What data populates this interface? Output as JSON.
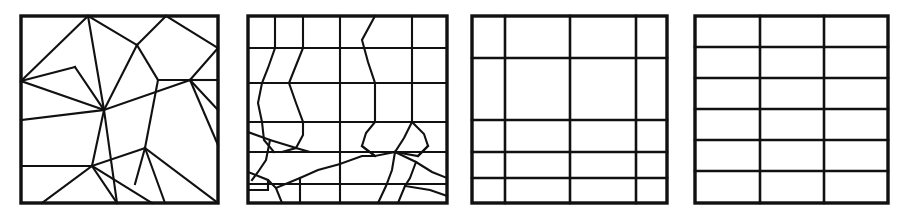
{
  "figure": {
    "title": "",
    "background_color": "#ffffff",
    "line_color": "#111111",
    "width": 908,
    "height": 216,
    "panel_count": 4
  },
  "chart_data": {
    "type": "diagram",
    "subtype": "mesh-partition-sequence",
    "title": "",
    "xlabel": "",
    "ylabel": "",
    "grid": false,
    "legend": null,
    "panels": [
      {
        "id": "panel-1",
        "label": "",
        "mesh_type": "unstructured-triangular",
        "cell_count": 26,
        "frame": {
          "x": 21,
          "y": 16,
          "width": 197,
          "height": 187
        },
        "frame_stroke_width": 3.4,
        "edge_stroke_width": 2.1,
        "vertices": [
          [
            21,
            16
          ],
          [
            218,
            16
          ],
          [
            218,
            203
          ],
          [
            21,
            203
          ],
          [
            88,
            16
          ],
          [
            166,
            16
          ],
          [
            21,
            81
          ],
          [
            75,
            67
          ],
          [
            137,
            45
          ],
          [
            104,
            110
          ],
          [
            158,
            80
          ],
          [
            218,
            80
          ],
          [
            182,
            80
          ],
          [
            21,
            120
          ],
          [
            21,
            166
          ],
          [
            92,
            166
          ],
          [
            135,
            148
          ],
          [
            166,
            126
          ],
          [
            190,
            104
          ],
          [
            218,
            110
          ],
          [
            42,
            203
          ],
          [
            117,
            203
          ],
          [
            165,
            203
          ],
          [
            196,
            203
          ],
          [
            152,
            203
          ],
          [
            218,
            145
          ]
        ],
        "edges": [
          [
            [
              21,
              16
            ],
            [
              218,
              16
            ]
          ],
          [
            [
              218,
              16
            ],
            [
              218,
              203
            ]
          ],
          [
            [
              218,
              203
            ],
            [
              21,
              203
            ]
          ],
          [
            [
              21,
              203
            ],
            [
              21,
              16
            ]
          ],
          [
            [
              88,
              16
            ],
            [
              21,
              81
            ]
          ],
          [
            [
              88,
              16
            ],
            [
              104,
              110
            ]
          ],
          [
            [
              88,
              16
            ],
            [
              137,
              45
            ]
          ],
          [
            [
              137,
              45
            ],
            [
              166,
              16
            ]
          ],
          [
            [
              137,
              45
            ],
            [
              104,
              110
            ]
          ],
          [
            [
              137,
              45
            ],
            [
              158,
              80
            ]
          ],
          [
            [
              166,
              16
            ],
            [
              218,
              48
            ]
          ],
          [
            [
              218,
              48
            ],
            [
              190,
              80
            ]
          ],
          [
            [
              190,
              80
            ],
            [
              218,
              80
            ]
          ],
          [
            [
              190,
              80
            ],
            [
              158,
              80
            ]
          ],
          [
            [
              158,
              80
            ],
            [
              145,
              148
            ]
          ],
          [
            [
              145,
              148
            ],
            [
              135,
              184
            ]
          ],
          [
            [
              21,
              81
            ],
            [
              75,
              67
            ]
          ],
          [
            [
              75,
              67
            ],
            [
              104,
              110
            ]
          ],
          [
            [
              21,
              81
            ],
            [
              104,
              110
            ]
          ],
          [
            [
              21,
              81
            ],
            [
              21,
              120
            ]
          ],
          [
            [
              21,
              120
            ],
            [
              104,
              110
            ]
          ],
          [
            [
              21,
              120
            ],
            [
              21,
              166
            ]
          ],
          [
            [
              104,
              110
            ],
            [
              117,
              203
            ]
          ],
          [
            [
              104,
              110
            ],
            [
              190,
              80
            ]
          ],
          [
            [
              104,
              110
            ],
            [
              92,
              166
            ]
          ],
          [
            [
              92,
              166
            ],
            [
              42,
              203
            ]
          ],
          [
            [
              21,
              166
            ],
            [
              92,
              166
            ]
          ],
          [
            [
              92,
              166
            ],
            [
              117,
              203
            ]
          ],
          [
            [
              92,
              166
            ],
            [
              152,
              203
            ]
          ],
          [
            [
              92,
              166
            ],
            [
              145,
              148
            ]
          ],
          [
            [
              145,
              148
            ],
            [
              165,
              203
            ]
          ],
          [
            [
              190,
              80
            ],
            [
              218,
              110
            ]
          ],
          [
            [
              190,
              80
            ],
            [
              218,
              145
            ]
          ],
          [
            [
              218,
              80
            ],
            [
              218,
              110
            ]
          ],
          [
            [
              190,
              80
            ],
            [
              190,
              80
            ]
          ],
          [
            [
              145,
              148
            ],
            [
              218,
              203
            ]
          ]
        ]
      },
      {
        "id": "panel-2",
        "label": "",
        "mesh_type": "semi-structured-polygonal",
        "cell_count": 40,
        "frame": {
          "x": 248,
          "y": 16,
          "width": 199,
          "height": 187
        },
        "frame_stroke_width": 3.4,
        "edge_stroke_width": 2.1,
        "row_lines_y": [
          48,
          83,
          122,
          152,
          184
        ],
        "col_lines_x": [
          275,
          303,
          340,
          375,
          412
        ]
      },
      {
        "id": "panel-3",
        "label": "",
        "mesh_type": "structured-rectangular-nonuniform",
        "cell_count": 20,
        "frame": {
          "x": 472,
          "y": 16,
          "width": 195,
          "height": 187
        },
        "frame_stroke_width": 3.4,
        "edge_stroke_width": 2.6,
        "columns": 4,
        "rows": 5,
        "col_lines_x": [
          505,
          570,
          636
        ],
        "row_lines_y": [
          58,
          120,
          152,
          178
        ]
      },
      {
        "id": "panel-4",
        "label": "",
        "mesh_type": "structured-rectangular-uniform",
        "cell_count": 18,
        "frame": {
          "x": 695,
          "y": 16,
          "width": 193,
          "height": 187
        },
        "frame_stroke_width": 3.4,
        "edge_stroke_width": 2.6,
        "columns": 3,
        "rows": 6,
        "col_lines_x": [
          760,
          824
        ],
        "row_lines_y": [
          47,
          78,
          109,
          140,
          171
        ]
      }
    ]
  }
}
